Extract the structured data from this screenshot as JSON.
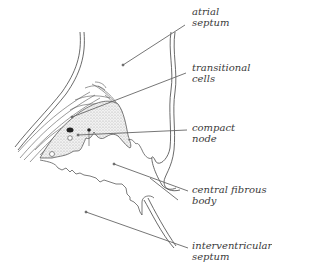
{
  "diagram": {
    "labels": [
      {
        "id": "atrial-septum",
        "lines": [
          "atrial",
          "septum"
        ]
      },
      {
        "id": "transitional-cells",
        "lines": [
          "transitional",
          "cells"
        ]
      },
      {
        "id": "compact-node",
        "lines": [
          "compact",
          "node"
        ]
      },
      {
        "id": "central-fibrous-body",
        "lines": [
          "central fibrous",
          "body"
        ]
      },
      {
        "id": "interventricular-septum",
        "lines": [
          "interventricular",
          "septum"
        ]
      }
    ],
    "colors": {
      "line": "#555555",
      "ink": "#3a3a3a",
      "stipple": "#bdbdbd"
    }
  }
}
